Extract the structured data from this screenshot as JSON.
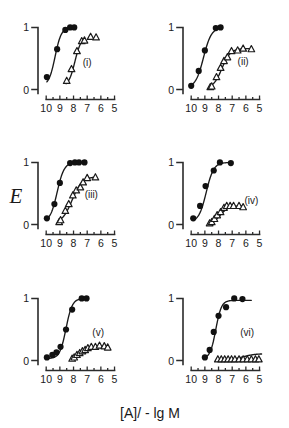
{
  "figure": {
    "x_axis_caption": "[A]/ - lg M",
    "y_axis_caption": "E",
    "width": 289,
    "height": 428,
    "background_color": "#ffffff",
    "ink_color": "#1a1a1a"
  },
  "axes": {
    "x_tick_labels": [
      "10",
      "9",
      "8",
      "7",
      "6",
      "5"
    ],
    "x_tick_values": [
      10,
      9,
      8,
      7,
      6,
      5
    ],
    "x_minor_values": [
      9.5,
      8.5,
      7.5,
      6.5,
      5.5
    ],
    "x_range": [
      10.6,
      4.6
    ],
    "y_tick_labels": [
      "0",
      "1"
    ],
    "y_tick_values": [
      0,
      1
    ],
    "y_range": [
      -0.04,
      1.12
    ],
    "grid": false,
    "legend": "none"
  },
  "chart_data": [
    {
      "type": "scatter",
      "panel": "(i)",
      "title": "(i)",
      "xlabel": "[A]/ - lg M",
      "ylabel": "E",
      "xlim": [
        10.6,
        4.6
      ],
      "ylim": [
        -0.04,
        1.12
      ],
      "series": [
        {
          "name": "filled-circles",
          "marker": "filled-circle",
          "x": [
            9.95,
            9.2,
            8.6,
            8.25,
            7.95
          ],
          "y": [
            0.2,
            0.65,
            0.96,
            1.0,
            1.0
          ],
          "curve_ec50": 9.35,
          "curve_top": 1.0,
          "curve_bottom": 0.06,
          "curve_slope": 1.9,
          "curve_x_start": 9.95,
          "curve_x_end": 7.95
        },
        {
          "name": "open-triangles",
          "marker": "open-triangle",
          "x": [
            8.5,
            8.15,
            7.75,
            7.4,
            7.2,
            6.75,
            6.35
          ],
          "y": [
            0.14,
            0.33,
            0.62,
            0.78,
            0.79,
            0.85,
            0.84
          ],
          "curve_ec50": 7.9,
          "curve_top": 0.85,
          "curve_bottom": 0.05,
          "curve_slope": 1.9,
          "curve_x_start": 8.55,
          "curve_x_end": 7.25
        }
      ]
    },
    {
      "type": "scatter",
      "panel": "(ii)",
      "title": "(ii)",
      "xlabel": "[A]/ - lg M",
      "ylabel": "E",
      "xlim": [
        10.6,
        4.6
      ],
      "ylim": [
        -0.04,
        1.12
      ],
      "series": [
        {
          "name": "filled-circles",
          "marker": "filled-circle",
          "x": [
            10.0,
            9.45,
            9.0,
            8.2,
            7.85
          ],
          "y": [
            0.06,
            0.3,
            0.63,
            0.99,
            1.0
          ],
          "curve_ec50": 9.1,
          "curve_top": 1.0,
          "curve_bottom": 0.03,
          "curve_slope": 1.5,
          "curve_x_start": 10.0,
          "curve_x_end": 7.85
        },
        {
          "name": "open-triangles",
          "marker": "open-triangle",
          "x": [
            8.6,
            8.5,
            8.15,
            7.85,
            7.6,
            7.35,
            7.05,
            6.6,
            6.2,
            5.6
          ],
          "y": [
            0.04,
            0.05,
            0.2,
            0.35,
            0.46,
            0.52,
            0.62,
            0.63,
            0.66,
            0.65
          ],
          "curve_ec50": 7.75,
          "curve_top": 0.66,
          "curve_bottom": 0.02,
          "curve_slope": 1.4,
          "curve_x_start": 8.6,
          "curve_x_end": 5.6
        }
      ]
    },
    {
      "type": "scatter",
      "panel": "(iii)",
      "title": "(iii)",
      "xlabel": "[A]/ - lg M",
      "ylabel": "E",
      "xlim": [
        10.6,
        4.6
      ],
      "ylim": [
        -0.04,
        1.12
      ],
      "series": [
        {
          "name": "filled-circles",
          "marker": "filled-circle",
          "x": [
            9.95,
            9.4,
            9.0,
            8.25,
            7.9,
            7.6,
            7.2
          ],
          "y": [
            0.1,
            0.33,
            0.67,
            0.99,
            1.0,
            1.0,
            1.0
          ],
          "curve_ec50": 9.2,
          "curve_top": 1.0,
          "curve_bottom": 0.04,
          "curve_slope": 1.7,
          "curve_x_start": 9.95,
          "curve_x_end": 7.2
        },
        {
          "name": "open-triangles",
          "marker": "open-triangle",
          "x": [
            9.05,
            8.95,
            8.6,
            8.35,
            8.05,
            7.8,
            7.5,
            7.3,
            7.0,
            6.4
          ],
          "y": [
            0.04,
            0.07,
            0.22,
            0.33,
            0.47,
            0.55,
            0.6,
            0.68,
            0.75,
            0.76
          ],
          "curve_ec50": 8.1,
          "curve_top": 0.77,
          "curve_bottom": 0.02,
          "curve_slope": 1.2,
          "curve_x_start": 9.1,
          "curve_x_end": 6.4
        }
      ]
    },
    {
      "type": "scatter",
      "panel": "(iv)",
      "title": "(iv)",
      "xlabel": "[A]/ - lg M",
      "ylabel": "E",
      "xlim": [
        10.6,
        4.6
      ],
      "ylim": [
        -0.04,
        1.12
      ],
      "series": [
        {
          "name": "filled-circles",
          "marker": "filled-circle",
          "x": [
            9.85,
            9.35,
            8.95,
            8.35,
            7.9,
            7.1
          ],
          "y": [
            0.1,
            0.3,
            0.62,
            0.87,
            1.0,
            0.99
          ],
          "curve_ec50": 8.9,
          "curve_top": 1.0,
          "curve_bottom": 0.04,
          "curve_slope": 1.6,
          "curve_x_start": 9.85,
          "curve_x_end": 7.1
        },
        {
          "name": "open-triangles",
          "marker": "open-triangle",
          "x": [
            8.65,
            8.5,
            8.3,
            8.1,
            7.85,
            7.6,
            7.4,
            7.15,
            6.9,
            6.5,
            6.2
          ],
          "y": [
            0.02,
            0.04,
            0.09,
            0.15,
            0.2,
            0.27,
            0.3,
            0.3,
            0.3,
            0.3,
            0.28
          ],
          "curve_ec50": 7.85,
          "curve_top": 0.3,
          "curve_bottom": 0.01,
          "curve_slope": 1.5,
          "curve_x_start": 8.7,
          "curve_x_end": 6.2
        }
      ]
    },
    {
      "type": "scatter",
      "panel": "(v)",
      "title": "(v)",
      "xlabel": "[A]/ - lg M",
      "ylabel": "E",
      "xlim": [
        10.6,
        4.6
      ],
      "ylim": [
        -0.04,
        1.12
      ],
      "series": [
        {
          "name": "filled-circles",
          "marker": "filled-circle",
          "x": [
            9.95,
            9.55,
            9.25,
            8.95,
            8.55,
            8.1,
            7.4,
            7.05
          ],
          "y": [
            0.05,
            0.09,
            0.13,
            0.22,
            0.5,
            0.82,
            1.0,
            1.0
          ],
          "curve_ec50": 8.55,
          "curve_top": 1.0,
          "curve_bottom": 0.03,
          "curve_slope": 1.9,
          "curve_x_start": 9.95,
          "curve_x_end": 7.05
        },
        {
          "name": "open-triangles",
          "marker": "open-triangle",
          "x": [
            8.1,
            7.95,
            7.75,
            7.55,
            7.35,
            7.15,
            6.95,
            6.7,
            6.4,
            6.1,
            5.75,
            5.5
          ],
          "y": [
            0.03,
            0.05,
            0.09,
            0.12,
            0.15,
            0.17,
            0.2,
            0.22,
            0.22,
            0.24,
            0.23,
            0.21
          ],
          "curve_ec50": 7.4,
          "curve_top": 0.23,
          "curve_bottom": 0.01,
          "curve_slope": 1.1,
          "curve_x_start": 8.15,
          "curve_x_end": 5.5
        }
      ]
    },
    {
      "type": "scatter",
      "panel": "(vi)",
      "title": "(vi)",
      "xlabel": "[A]/ - lg M",
      "ylabel": "E",
      "xlim": [
        10.6,
        4.6
      ],
      "ylim": [
        -0.04,
        1.12
      ],
      "series": [
        {
          "name": "filled-circles",
          "marker": "filled-circle",
          "x": [
            9.0,
            8.65,
            8.35,
            8.0,
            7.45,
            6.85,
            6.25
          ],
          "y": [
            0.05,
            0.17,
            0.46,
            0.72,
            0.86,
            1.0,
            0.99
          ],
          "curve_ec50": 8.2,
          "curve_top": 0.97,
          "curve_bottom": 0.03,
          "curve_slope": 2.1,
          "curve_x_start": 9.0,
          "curve_x_end": 5.6
        },
        {
          "name": "open-triangles",
          "marker": "open-triangle",
          "x": [
            8.05,
            7.8,
            7.55,
            7.3,
            7.05,
            6.8,
            6.5,
            6.2,
            5.9,
            5.6,
            5.3,
            5.05
          ],
          "y": [
            0.02,
            0.02,
            0.02,
            0.02,
            0.02,
            0.02,
            0.02,
            0.02,
            0.02,
            0.02,
            0.02,
            0.02
          ],
          "curve_ec50": 6.2,
          "curve_top": 0.11,
          "curve_bottom": 0.01,
          "curve_slope": 1.0,
          "curve_x_start": 8.1,
          "curve_x_end": 4.85
        }
      ]
    }
  ],
  "layout": {
    "columns": 2,
    "rows": 3,
    "panel_order": [
      "(i)",
      "(ii)",
      "(iii)",
      "(iv)",
      "(v)",
      "(vi)"
    ],
    "panel_tag_positions": [
      {
        "panel": "(i)",
        "x": 7.0,
        "y": 0.38
      },
      {
        "panel": "(ii)",
        "x": 6.2,
        "y": 0.4
      },
      {
        "panel": "(iii)",
        "x": 6.7,
        "y": 0.42
      },
      {
        "panel": "(iv)",
        "x": 5.6,
        "y": 0.33
      },
      {
        "panel": "(v)",
        "x": 6.2,
        "y": 0.4
      },
      {
        "panel": "(vi)",
        "x": 5.9,
        "y": 0.4
      }
    ]
  }
}
